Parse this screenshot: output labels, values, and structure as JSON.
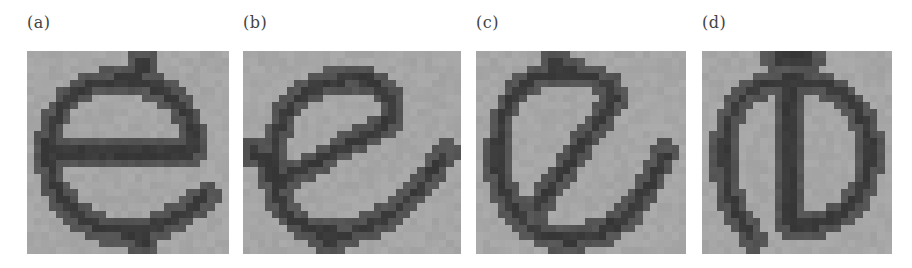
{
  "figure": {
    "panels": [
      {
        "id": "a",
        "label": "(a)",
        "glyph": "e",
        "description": "Pixelated lowercase letter e, upright",
        "x": 27,
        "width": 202,
        "label_x": 27,
        "grid": [
          28,
          28
        ],
        "strokes": [
          {
            "type": "path",
            "d": "M3,14 L23,14 C24,9 20,4 13,4 C7,4 3,8 3,14 C3,21 8,25 14,25 C18,25 21,23 25,20"
          },
          {
            "type": "path",
            "d": "M16,1 L16,3"
          },
          {
            "type": "path",
            "d": "M16,25 L16,27"
          }
        ]
      },
      {
        "id": "b",
        "label": "(b)",
        "glyph": "e",
        "description": "Pixelated lowercase letter e, rotated counter-clockwise",
        "x": 243,
        "width": 218,
        "label_x": 243,
        "grid": [
          30,
          28
        ],
        "strokes": [
          {
            "type": "path",
            "d": "M5,18 L20,10 C22,6 18,3 13,4 C7,5 4,10 4,16 C4,23 9,26 15,25 C20,24 24,20 28,14"
          },
          {
            "type": "path",
            "d": "M1,14 L3,15"
          },
          {
            "type": "path",
            "d": "M12,25 L12,27"
          }
        ]
      },
      {
        "id": "c",
        "label": "(c)",
        "glyph": "e",
        "description": "Pixelated lowercase letter e, rotated further counter-clockwise",
        "x": 476,
        "width": 210,
        "label_x": 476,
        "grid": [
          29,
          28
        ],
        "strokes": [
          {
            "type": "path",
            "d": "M8,22 L19,7 C19,4 16,3 12,3 C6,3 3,8 3,14 C3,21 7,26 13,26 C19,26 23,22 26,14"
          },
          {
            "type": "path",
            "d": "M11,1 L11,3"
          }
        ]
      },
      {
        "id": "d",
        "label": "(d)",
        "glyph": "e",
        "description": "Pixelated lowercase letter e, rotated 90 degrees (bar vertical)",
        "x": 702,
        "width": 190,
        "label_x": 702,
        "grid": [
          26,
          28
        ],
        "strokes": [
          {
            "type": "path",
            "d": "M12,4 L12,24 C18,25 23,21 23,14 C23,8 19,4 12,4 C6,4 3,8 3,14 C3,19 4,22 7,26"
          },
          {
            "type": "path",
            "d": "M10,1 L15,1"
          }
        ]
      }
    ],
    "colors": {
      "background": "#a6a6a6",
      "stroke_outer": "#555555",
      "stroke_inner": "#3a3a3a",
      "label": "#444444"
    }
  }
}
